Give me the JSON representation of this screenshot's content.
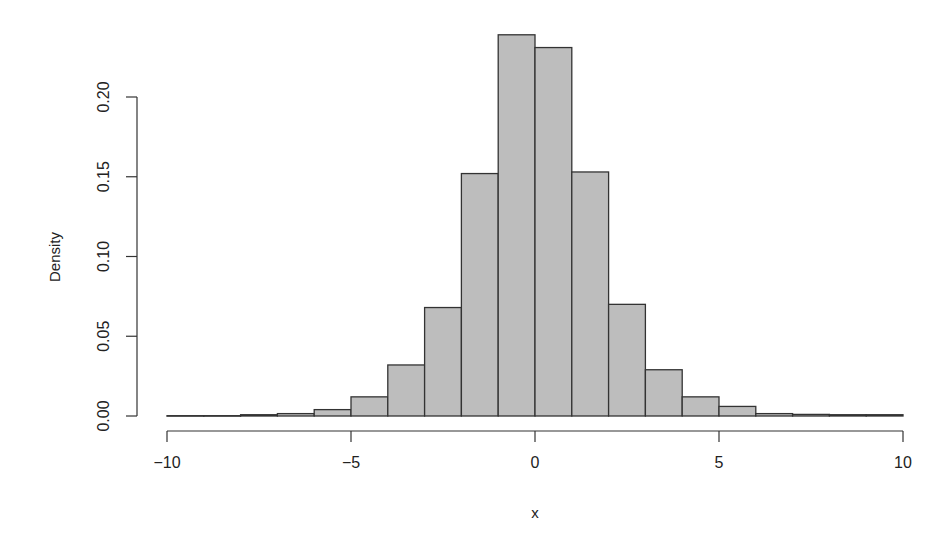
{
  "chart_data": {
    "type": "bar",
    "subtype": "histogram",
    "title": "",
    "xlabel": "x",
    "ylabel": "Density",
    "xlim": [
      -10,
      10
    ],
    "ylim": [
      0,
      0.2
    ],
    "grid": false,
    "legend": null,
    "bar_fill": "#bdbdbd",
    "bar_edge": "#333333",
    "x_ticks": [
      -10,
      -5,
      0,
      5,
      10
    ],
    "x_tick_labels": [
      "−10",
      "−5",
      "0",
      "5",
      "10"
    ],
    "y_ticks": [
      0.0,
      0.05,
      0.1,
      0.15,
      0.2
    ],
    "y_tick_labels": [
      "0.00",
      "0.05",
      "0.10",
      "0.15",
      "0.20"
    ],
    "bins": [
      {
        "from": -10,
        "to": -9,
        "density": 0.0002
      },
      {
        "from": -9,
        "to": -8,
        "density": 0.0002
      },
      {
        "from": -8,
        "to": -7,
        "density": 0.0008
      },
      {
        "from": -7,
        "to": -6,
        "density": 0.0015
      },
      {
        "from": -6,
        "to": -5,
        "density": 0.004
      },
      {
        "from": -5,
        "to": -4,
        "density": 0.012
      },
      {
        "from": -4,
        "to": -3,
        "density": 0.032
      },
      {
        "from": -3,
        "to": -2,
        "density": 0.068
      },
      {
        "from": -2,
        "to": -1,
        "density": 0.152
      },
      {
        "from": -1,
        "to": 0,
        "density": 0.239
      },
      {
        "from": 0,
        "to": 1,
        "density": 0.231
      },
      {
        "from": 1,
        "to": 2,
        "density": 0.153
      },
      {
        "from": 2,
        "to": 3,
        "density": 0.07
      },
      {
        "from": 3,
        "to": 4,
        "density": 0.029
      },
      {
        "from": 4,
        "to": 5,
        "density": 0.012
      },
      {
        "from": 5,
        "to": 6,
        "density": 0.006
      },
      {
        "from": 6,
        "to": 7,
        "density": 0.0015
      },
      {
        "from": 7,
        "to": 8,
        "density": 0.001
      },
      {
        "from": 8,
        "to": 9,
        "density": 0.0008
      },
      {
        "from": 9,
        "to": 10,
        "density": 0.0008
      }
    ]
  }
}
